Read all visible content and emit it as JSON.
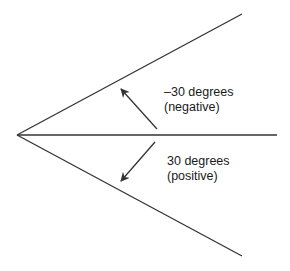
{
  "diagram": {
    "width": 290,
    "height": 271,
    "background": "#ffffff",
    "line_color": "#333333",
    "vertex": {
      "x": 17,
      "y": 135
    },
    "rays": [
      {
        "name": "upper-ray",
        "x2": 242,
        "y2": 14
      },
      {
        "name": "center-ray",
        "x2": 277,
        "y2": 135
      },
      {
        "name": "lower-ray",
        "x2": 242,
        "y2": 256
      }
    ],
    "arrows": [
      {
        "name": "negative-rotation-arrow",
        "x1": 157,
        "y1": 129,
        "x2": 121,
        "y2": 89
      },
      {
        "name": "positive-rotation-arrow",
        "x1": 155,
        "y1": 142,
        "x2": 121,
        "y2": 181
      }
    ],
    "labels": {
      "negative": {
        "x": 164,
        "line1": "–30 degrees",
        "line2": "(negative)",
        "y1": 96,
        "y2": 111
      },
      "positive": {
        "x": 167,
        "line1": "30 degrees",
        "line2": "(positive)",
        "y1": 165,
        "y2": 180
      }
    }
  }
}
